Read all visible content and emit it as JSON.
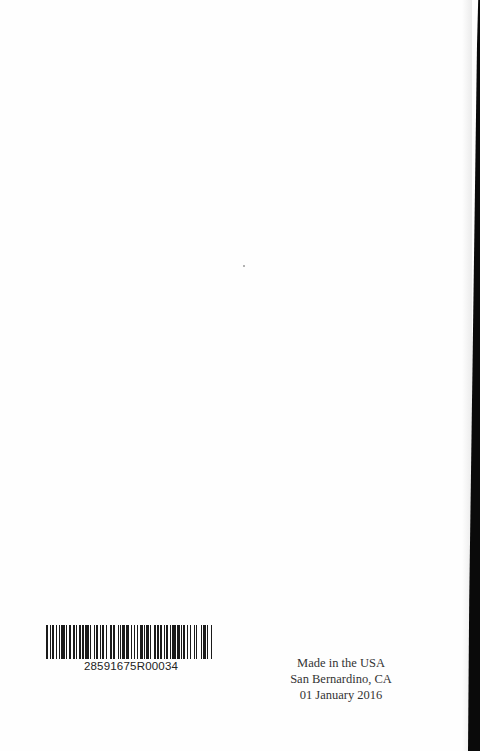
{
  "barcode": {
    "number": "28591675R00034",
    "bars": [
      2,
      1,
      1,
      1,
      2,
      1,
      1,
      2,
      1,
      1,
      3,
      1,
      1,
      1,
      2,
      2,
      1,
      1,
      1,
      2,
      1,
      1,
      2,
      1,
      3,
      1,
      1,
      2,
      1,
      1,
      2,
      1,
      1,
      1,
      2,
      1,
      1,
      3,
      1,
      1,
      2,
      2,
      1,
      1,
      1,
      1,
      2,
      1,
      3,
      1,
      1,
      2,
      1,
      1,
      1,
      2,
      2,
      1,
      1,
      1,
      2,
      1,
      1,
      3,
      1,
      1,
      2,
      1,
      1,
      2,
      1,
      1,
      1,
      2,
      1,
      1,
      3,
      1,
      2,
      1,
      1,
      1,
      2,
      1,
      1,
      2,
      1,
      2,
      1,
      1,
      1,
      3,
      1,
      1,
      2,
      1,
      1,
      2,
      1,
      1
    ]
  },
  "imprint": {
    "line1": "Made in the USA",
    "line2": "San Bernardino, CA",
    "line3": "01 January 2016"
  }
}
